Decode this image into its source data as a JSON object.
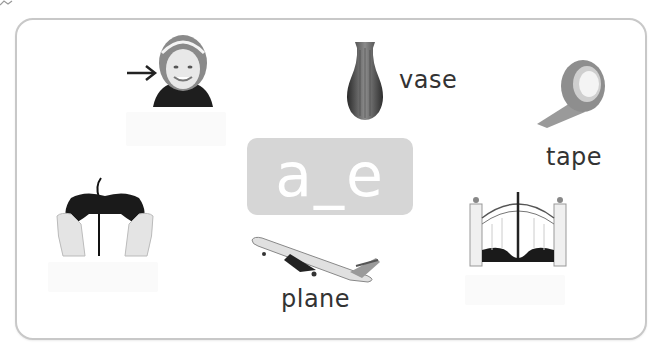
{
  "worksheet": {
    "pattern": "a_e",
    "pattern_box_color": "#d6d6d6",
    "items": [
      {
        "id": "girl",
        "label": "",
        "label_visible": false,
        "has_arrow": true
      },
      {
        "id": "vase",
        "label": "vase",
        "label_visible": true
      },
      {
        "id": "tape",
        "label": "tape",
        "label_visible": true
      },
      {
        "id": "game-controller",
        "label": "",
        "label_visible": false
      },
      {
        "id": "plane",
        "label": "plane",
        "label_visible": true
      },
      {
        "id": "gate",
        "label": "",
        "label_visible": false
      }
    ]
  }
}
